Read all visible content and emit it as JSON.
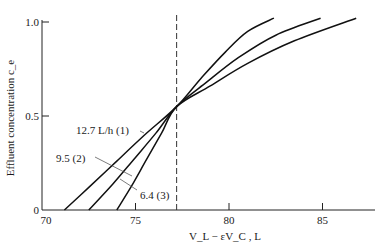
{
  "chart_data": {
    "type": "line",
    "title": "",
    "xlabel": "V_L − εV_C , L",
    "ylabel": "Effluent concentration c_e",
    "xlim": [
      70,
      88
    ],
    "ylim": [
      0,
      1.02
    ],
    "grid": false,
    "legend": "inline labels",
    "x_ticks": [
      70,
      75,
      80,
      85
    ],
    "x_tick_labels": [
      "70",
      "75",
      "80",
      "85"
    ],
    "y_ticks": [
      0,
      0.5,
      1.0
    ],
    "y_tick_labels": [
      "0",
      "0.5",
      "1.0"
    ],
    "reference_line": {
      "type": "vertical",
      "style": "dashed",
      "x": 77.2
    },
    "series": [
      {
        "name": "12.7 L/h (1)",
        "label": "12.7 L/h (1)",
        "x": [
          71.2,
          72.5,
          74.0,
          75.5,
          77.2,
          78.5,
          79.8,
          81.0,
          82.4
        ],
        "y": [
          0.0,
          0.12,
          0.26,
          0.4,
          0.55,
          0.7,
          0.84,
          0.95,
          1.02
        ]
      },
      {
        "name": "9.5 (2)",
        "label": "9.5 (2)",
        "x": [
          72.5,
          73.8,
          75.0,
          76.1,
          77.2,
          78.8,
          80.5,
          82.5,
          84.9
        ],
        "y": [
          0.0,
          0.14,
          0.28,
          0.41,
          0.55,
          0.68,
          0.81,
          0.93,
          1.02
        ]
      },
      {
        "name": "6.4 (3)",
        "label": "6.4 (3)",
        "x": [
          74.0,
          74.8,
          75.6,
          76.4,
          77.2,
          79.0,
          81.0,
          83.5,
          86.8
        ],
        "y": [
          0.0,
          0.13,
          0.27,
          0.41,
          0.55,
          0.66,
          0.78,
          0.9,
          1.02
        ]
      }
    ]
  }
}
